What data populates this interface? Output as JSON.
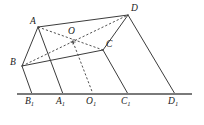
{
  "figure": {
    "stroke_color": "#3c3c3c",
    "baseline_color": "#7a7a7a",
    "label_color": "#1a1a1a",
    "background_color": "#ffffff",
    "solid_width": 1.0,
    "dashed_width": 0.9,
    "baseline_width": 1.8,
    "dash_pattern": "2.2,2.0"
  },
  "points": [
    {
      "id": "A",
      "label": "A",
      "sub": "",
      "x": 38,
      "y": 27,
      "label_x": 30,
      "label_y": 17
    },
    {
      "id": "D",
      "label": "D",
      "sub": "",
      "x": 128,
      "y": 15,
      "label_x": 131,
      "label_y": 4
    },
    {
      "id": "B",
      "label": "B",
      "sub": "",
      "x": 22,
      "y": 66,
      "label_x": 10,
      "label_y": 58
    },
    {
      "id": "C",
      "label": "C",
      "sub": "",
      "x": 103,
      "y": 50,
      "label_x": 106,
      "label_y": 40
    },
    {
      "id": "O",
      "label": "O",
      "sub": "",
      "x": 73,
      "y": 42,
      "label_x": 68,
      "label_y": 27
    },
    {
      "id": "B1",
      "label": "B",
      "sub": "1",
      "x": 32,
      "y": 94,
      "label_x": 25,
      "label_y": 97
    },
    {
      "id": "A1",
      "label": "A",
      "sub": "1",
      "x": 63,
      "y": 94,
      "label_x": 56,
      "label_y": 97
    },
    {
      "id": "O1",
      "label": "O",
      "sub": "1",
      "x": 93,
      "y": 94,
      "label_x": 86,
      "label_y": 97
    },
    {
      "id": "C1",
      "label": "C",
      "sub": "1",
      "x": 128,
      "y": 94,
      "label_x": 121,
      "label_y": 97
    },
    {
      "id": "D1",
      "label": "D",
      "sub": "1",
      "x": 175,
      "y": 94,
      "label_x": 168,
      "label_y": 97
    }
  ],
  "baseline": {
    "x1": 17,
    "y1": 94,
    "x2": 192,
    "y2": 94
  },
  "solid_edges": [
    {
      "name": "edge-A-D",
      "from": "A",
      "to": "D"
    },
    {
      "name": "edge-A-B",
      "from": "A",
      "to": "B"
    },
    {
      "name": "edge-B-C",
      "from": "B",
      "to": "C"
    },
    {
      "name": "edge-C-D",
      "from": "C",
      "to": "D"
    },
    {
      "name": "edge-B-B1",
      "from": "B",
      "to": "B1"
    },
    {
      "name": "edge-A-A1",
      "from": "A",
      "to": "A1"
    },
    {
      "name": "edge-C-C1",
      "from": "C",
      "to": "C1"
    },
    {
      "name": "edge-D-D1",
      "from": "D",
      "to": "D1"
    }
  ],
  "dashed_edges": [
    {
      "name": "diagonal-B-D",
      "from": "B",
      "to": "D"
    },
    {
      "name": "diagonal-A-C",
      "from": "A",
      "to": "C"
    },
    {
      "name": "projection-O-O1",
      "from": "O",
      "to": "O1"
    }
  ],
  "center_marker": {
    "name": "center-point-O",
    "x": 73,
    "y": 42,
    "size": 2.6
  }
}
